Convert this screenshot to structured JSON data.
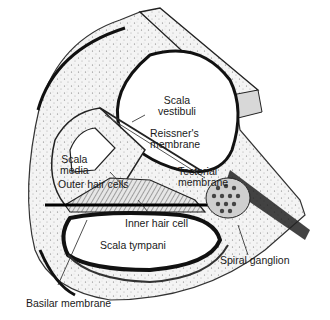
{
  "figure": {
    "labels": {
      "scala_vestibuli": [
        "Scala",
        "vestibuli"
      ],
      "reissners_membrane": [
        "Reissner's",
        "membrane"
      ],
      "tectorial_membrane": [
        "Tectorial",
        "membrane"
      ],
      "scala_media": [
        "Scala",
        "media"
      ],
      "outer_hair_cells": "Outer hair cells",
      "inner_hair_cell": "Inner hair cell",
      "scala_tympani": "Scala tympani",
      "spiral_ganglion": "Spiral ganglion",
      "basilar_membrane": "Basilar membrane"
    },
    "colors": {
      "ink": "#1a1a1a",
      "stipple": "#8a8a8a",
      "background": "#ffffff"
    }
  }
}
